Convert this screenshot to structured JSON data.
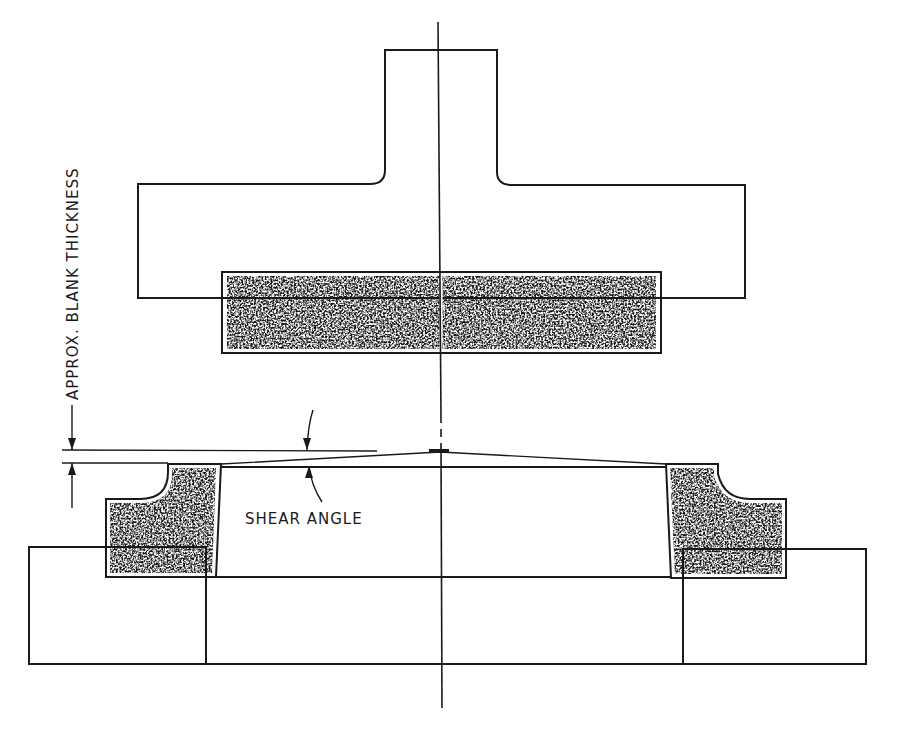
{
  "diagram": {
    "type": "cross-section drawing",
    "labels": {
      "blank_thickness": "APPROX. BLANK THICKNESS",
      "shear_angle": "SHEAR ANGLE"
    },
    "components": [
      {
        "name": "upper punch holder",
        "fill": "diagonal hatch"
      },
      {
        "name": "upper punch insert",
        "fill": "stipple"
      },
      {
        "name": "lower die ring insert",
        "fill": "stipple"
      },
      {
        "name": "lower die block",
        "fill": "diagonal hatch"
      },
      {
        "name": "center line",
        "fill": "line"
      }
    ],
    "colors": {
      "ink": "#1a1a1a",
      "paper": "#ffffff"
    }
  }
}
